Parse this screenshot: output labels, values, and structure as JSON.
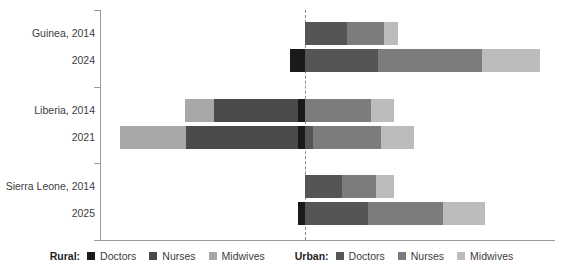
{
  "chart_data": {
    "type": "bar",
    "subtype": "diverging-stacked-horizontal",
    "title": "",
    "xlabel": "",
    "ylabel": "",
    "grid": false,
    "baseline_label": "0",
    "legend_position": "bottom",
    "categories": [
      "Guinea, 2014",
      "2024",
      "Liberia, 2014",
      "2021",
      "Sierra Leone, 2014",
      "2025"
    ],
    "groups": [
      {
        "country": "Guinea",
        "rows": [
          {
            "label": "Guinea, 2014",
            "year": "2014"
          },
          {
            "label": "2024",
            "year": "2024"
          }
        ]
      },
      {
        "country": "Liberia",
        "rows": [
          {
            "label": "Liberia, 2014",
            "year": "2014"
          },
          {
            "label": "2021",
            "year": "2021"
          }
        ]
      },
      {
        "country": "Sierra Leone",
        "rows": [
          {
            "label": "Sierra Leone, 2014",
            "year": "2014"
          },
          {
            "label": "2025",
            "year": "2025"
          }
        ]
      }
    ],
    "series": [
      {
        "name": "Rural: Doctors",
        "side": "rural",
        "role": "Doctors",
        "color": "#1a1a1a"
      },
      {
        "name": "Rural: Nurses",
        "side": "rural",
        "role": "Nurses",
        "color": "#4a4a4a"
      },
      {
        "name": "Rural: Midwives",
        "side": "rural",
        "role": "Midwives",
        "color": "#a8a8a8"
      },
      {
        "name": "Urban: Doctors",
        "side": "urban",
        "role": "Doctors",
        "color": "#555555"
      },
      {
        "name": "Urban: Nurses",
        "side": "urban",
        "role": "Nurses",
        "color": "#7c7c7c"
      },
      {
        "name": "Urban: Midwives",
        "side": "urban",
        "role": "Midwives",
        "color": "#bcbcbc"
      }
    ],
    "unit_note": "values in px-derived relative units, baseline at 0",
    "data": [
      {
        "label": "Guinea, 2014",
        "rural": {
          "Doctors": 0,
          "Nurses": 0,
          "Midwives": 0
        },
        "urban": {
          "Doctors": 42,
          "Nurses": 37,
          "Midwives": 14
        }
      },
      {
        "label": "2024",
        "rural": {
          "Doctors": 15,
          "Nurses": 0,
          "Midwives": 0
        },
        "urban": {
          "Doctors": 73,
          "Nurses": 104,
          "Midwives": 58
        }
      },
      {
        "label": "Liberia, 2014",
        "rural": {
          "Doctors": 7,
          "Nurses": 84,
          "Midwives": 29
        },
        "urban": {
          "Doctors": 0,
          "Nurses": 66,
          "Midwives": 23
        }
      },
      {
        "label": "2021",
        "rural": {
          "Doctors": 7,
          "Nurses": 112,
          "Midwives": 66
        },
        "urban": {
          "Doctors": 8,
          "Nurses": 68,
          "Midwives": 33
        }
      },
      {
        "label": "Sierra Leone, 2014",
        "rural": {
          "Doctors": 0,
          "Nurses": 0,
          "Midwives": 0
        },
        "urban": {
          "Doctors": 37,
          "Nurses": 34,
          "Midwives": 18
        }
      },
      {
        "label": "2025",
        "rural": {
          "Doctors": 7,
          "Nurses": 0,
          "Midwives": 0
        },
        "urban": {
          "Doctors": 63,
          "Nurses": 75,
          "Midwives": 42
        }
      }
    ]
  },
  "labels": {
    "guinea_2014": "Guinea, 2014",
    "guinea_2024": "2024",
    "liberia_2014": "Liberia, 2014",
    "liberia_2021": "2021",
    "sierraleone_2014": "Sierra Leone, 2014",
    "sierraleone_2025": "2025"
  },
  "legend": {
    "rural": {
      "title": "Rural:",
      "items": [
        {
          "label": "Doctors",
          "color": "#1a1a1a"
        },
        {
          "label": "Nurses",
          "color": "#4a4a4a"
        },
        {
          "label": "Midwives",
          "color": "#a8a8a8"
        }
      ]
    },
    "urban": {
      "title": "Urban:",
      "items": [
        {
          "label": "Doctors",
          "color": "#555555"
        },
        {
          "label": "Nurses",
          "color": "#7c7c7c"
        },
        {
          "label": "Midwives",
          "color": "#bcbcbc"
        }
      ]
    }
  },
  "colors": {
    "axis": "#9a9a9a",
    "baseline": "#8c8c8c",
    "text": "#3d3d3d",
    "background": "#ffffff"
  }
}
